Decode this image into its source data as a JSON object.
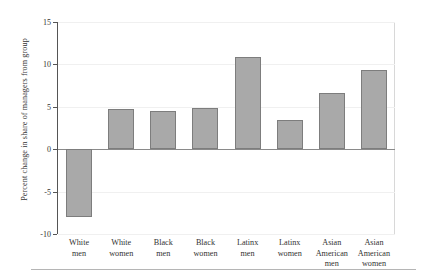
{
  "chart_data": {
    "type": "bar",
    "title": "",
    "xlabel": "",
    "ylabel": "Percent change in share of managers from group",
    "ylim": [
      -10,
      15
    ],
    "yticks": [
      -10,
      -5,
      0,
      5,
      10,
      15
    ],
    "ytick_labels": [
      "-10",
      "-5",
      "0",
      "5",
      "10",
      "15"
    ],
    "grid": true,
    "legend": "none",
    "bar_color": "#a9a9a9",
    "bar_edge_color": "#7d7d7d",
    "categories": [
      "White men",
      "White women",
      "Black men",
      "Black women",
      "Latinx men",
      "Latinx women",
      "Asian American men",
      "Asian American women"
    ],
    "category_lines": [
      [
        "White",
        "men"
      ],
      [
        "White",
        "women"
      ],
      [
        "Black",
        "men"
      ],
      [
        "Black",
        "women"
      ],
      [
        "Latinx",
        "men"
      ],
      [
        "Latinx",
        "women"
      ],
      [
        "Asian",
        "American",
        "men"
      ],
      [
        "Asian",
        "American",
        "women"
      ]
    ],
    "values": [
      -8.0,
      4.7,
      4.5,
      4.9,
      10.9,
      3.5,
      6.6,
      9.3
    ]
  }
}
